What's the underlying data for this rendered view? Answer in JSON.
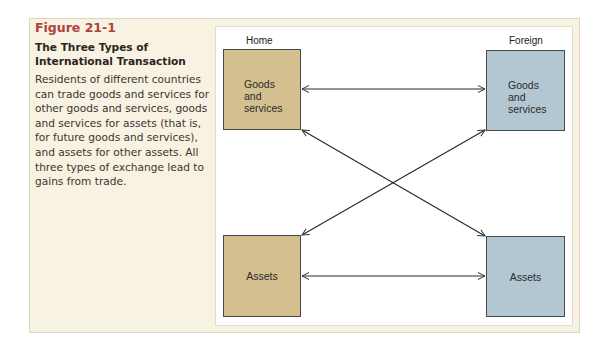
{
  "figure": {
    "number": "Figure 21-1",
    "title": "The Three Types of International Transaction",
    "description": "Residents of different countries can trade goods and services for other goods and services, goods and services for assets (that is, for future goods and services), and assets for other assets. All three types of exchange lead to gains from trade."
  },
  "diagram": {
    "columns": {
      "home": "Home",
      "foreign": "Foreign"
    },
    "boxes": {
      "home_goods": {
        "lines": [
          "Goods",
          "and",
          "services"
        ]
      },
      "foreign_goods": {
        "lines": [
          "Goods",
          "and",
          "services"
        ]
      },
      "home_assets": {
        "label": "Assets"
      },
      "foreign_assets": {
        "label": "Assets"
      }
    },
    "arrows": [
      {
        "from": "home_goods",
        "to": "foreign_goods",
        "type": "double-headed"
      },
      {
        "from": "home_assets",
        "to": "foreign_assets",
        "type": "double-headed"
      },
      {
        "from": "home_goods",
        "to": "foreign_assets",
        "type": "double-headed"
      },
      {
        "from": "home_assets",
        "to": "foreign_goods",
        "type": "double-headed"
      }
    ],
    "colors": {
      "home_fill": "#d4c08f",
      "foreign_fill": "#b3c7d3",
      "figure_number": "#b0413e",
      "panel_bg": "#f7f2e2"
    }
  }
}
